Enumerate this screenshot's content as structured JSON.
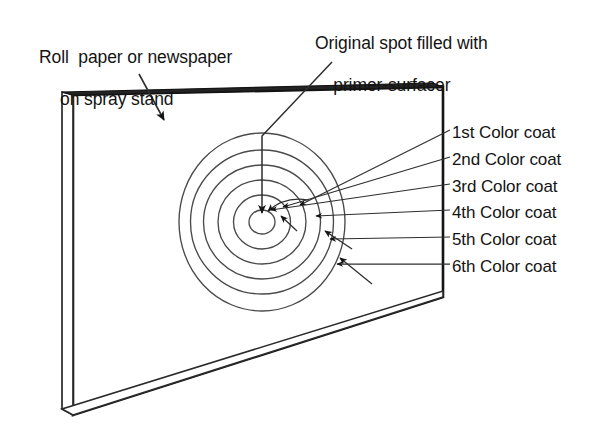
{
  "figure": {
    "title_absent": true,
    "background_color": "#ffffff",
    "ink_color": "#141414",
    "line_color": "#3a3a3a"
  },
  "callouts": {
    "roll_paper": {
      "line1": "Roll  paper or newspaper",
      "line2": "on spray stand"
    },
    "original_spot": {
      "line1": "Original spot filled with",
      "line2": "primer-surfacer"
    }
  },
  "coat_labels": [
    {
      "text": "1st Color coat"
    },
    {
      "text": "2nd Color coat"
    },
    {
      "text": "3rd Color coat"
    },
    {
      "text": "4th Color coat"
    },
    {
      "text": "5th Color coat"
    },
    {
      "text": "6th Color coat"
    }
  ],
  "panel": {
    "description": "spray-out panel drawn in perspective with visible edge thickness"
  },
  "spray_pattern": {
    "ring_count": 6,
    "description": "six concentric elliptical color coats expanding from the primer-surfacer spot"
  }
}
